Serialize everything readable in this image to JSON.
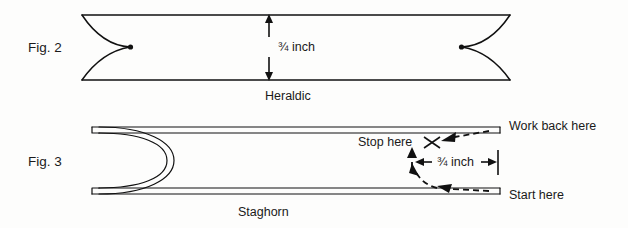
{
  "figure": {
    "title_visible": false,
    "background_color": "#fdfdfc",
    "ink_color": "#111111"
  },
  "fig2": {
    "label": "Fig. 2",
    "caption": "Heraldic",
    "measurement": "¾ inch",
    "description_visible_text": [
      "Fig. 2",
      "¾ inch",
      "Heraldic"
    ]
  },
  "fig3": {
    "label": "Fig. 3",
    "caption": "Staghorn",
    "measurement": "¾ inch",
    "annotations": {
      "stop_here": "Stop here",
      "work_back_here": "Work back here",
      "start_here": "Start here"
    },
    "description_visible_text": [
      "Fig. 3",
      "Stop here",
      "Work back here",
      "¾ inch",
      "Start here",
      "Staghorn"
    ]
  },
  "icons": {
    "x_mark": "x-mark-icon",
    "arrow_up": "arrow-up-icon",
    "arrow_down": "arrow-down-icon",
    "arrow_left": "arrow-left-icon",
    "arrow_right": "arrow-right-icon"
  }
}
